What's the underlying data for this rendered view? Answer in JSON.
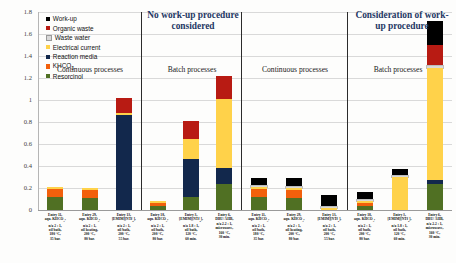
{
  "figure": {
    "panels": [
      {
        "title": "No work-up procedure considered"
      },
      {
        "title": "Consideration of work-up procedure"
      }
    ],
    "group_labels": [
      "Continuous processes",
      "Batch processes",
      "Continuous processes",
      "Batch processes"
    ]
  },
  "chart_data": {
    "type": "bar",
    "stacked": true,
    "title": "",
    "xlabel": "",
    "ylabel": "",
    "ylim": [
      0,
      1.8
    ],
    "yticks": [
      "0",
      "0.2",
      "0.4",
      "0.6",
      "0.8",
      "1",
      "1.2",
      "1.4",
      "1.6",
      "1.8"
    ],
    "grid": true,
    "legend_position": "top-left",
    "legend": [
      {
        "name": "Work-up",
        "color": "#000000"
      },
      {
        "name": "Organic waste",
        "color": "#B81B13"
      },
      {
        "name": "Waste water",
        "color": "#D9D9D9"
      },
      {
        "name": "Electrical current",
        "color": "#FFD24A"
      },
      {
        "name": "Reaction media",
        "color": "#12284C"
      },
      {
        "name": "KHCO3",
        "color": "#F2600C"
      },
      {
        "name": "Resorcinol",
        "color": "#507023"
      }
    ],
    "series": [
      {
        "name": "Resorcinol",
        "color": "#507023",
        "values": [
          0.115,
          0.112,
          0.0,
          0.04,
          0.115,
          0.235,
          0.115,
          0.112,
          0.0,
          0.04,
          0.0,
          0.235
        ]
      },
      {
        "name": "KHCO3",
        "color": "#F2600C",
        "values": [
          0.075,
          0.073,
          0.0,
          0.028,
          0.0,
          0.0,
          0.075,
          0.073,
          0.0,
          0.028,
          0.0,
          0.0
        ]
      },
      {
        "name": "Reaction media",
        "color": "#12284C",
        "values": [
          0.0,
          0.0,
          0.865,
          0.0,
          0.345,
          0.145,
          0.0,
          0.0,
          0.0,
          0.0,
          0.0,
          0.04
        ]
      },
      {
        "name": "Electrical current",
        "color": "#FFD24A",
        "values": [
          0.015,
          0.015,
          0.02,
          0.015,
          0.185,
          0.63,
          0.015,
          0.015,
          0.02,
          0.015,
          0.3,
          1.02
        ]
      },
      {
        "name": "Waste water",
        "color": "#D9D9D9",
        "values": [
          0.0,
          0.0,
          0.0,
          0.0,
          0.0,
          0.0,
          0.012,
          0.012,
          0.01,
          0.012,
          0.01,
          0.012
        ]
      },
      {
        "name": "Organic waste",
        "color": "#B81B13",
        "values": [
          0.0,
          0.0,
          0.13,
          0.0,
          0.16,
          0.21,
          0.0,
          0.0,
          0.0,
          0.0,
          0.0,
          0.19
        ]
      },
      {
        "name": "Work-up",
        "color": "#000000",
        "values": [
          0.0,
          0.0,
          0.0,
          0.0,
          0.0,
          0.0,
          0.075,
          0.075,
          0.105,
          0.065,
          0.065,
          0.225
        ]
      }
    ],
    "categories": [
      "Entry 11, aqu. KHCO3, n/a 2 : 1, oil bath, 180 °C, 35 bar.",
      "Entry 29, aqu. KHCO3, n/a 2 : 1, oil heating, 200 °C, 80 bar.",
      "Entry 13, [EMIM][NTf2], n/a 2 : 1, oil bath, 200 °C, 55 bar.",
      "Entry 18, aqu. KHCO3, n/a 2 : 1, oil bath, 200 °C, 80 bar.",
      "Entry 3, [EMIM][NTf2], n/a 1.8 : 1, oil bath, 120 °C, 60 min.",
      "Entry 6, DBU/ AHB, n/a 2.2 : 1, microwave, 160 °C, 30 min.",
      "Entry 11, aqu. KHCO3, n/a 2 : 1, oil bath, 180 °C, 35 bar.",
      "Entry 29, aqu. KHCO3, n/a 2 : 1, oil heating, 200 °C, 80 bar.",
      "Entry 13, [EMIM][NTf2], n/a 2 : 1, oil bath, 200 °C, 55 bar.",
      "Entry 18, aqu. KHCO3, n/a 2 : 1, oil bath, 200 °C, 80 bar.",
      "Entry 3, [EMIM][NTf2], n/a 1.8 : 1, oil bath, 120 °C, 60 min.",
      "Entry 6, DBU/ AHB, n/a 2.2 : 1, microwave, 160 °C, 30 min."
    ],
    "category_lines": [
      [
        "Entry 11,",
        "aqu. KHCO3,",
        "n/a 2 : 1,",
        "oil bath,",
        "180 °C,",
        "35 bar."
      ],
      [
        "Entry 29,",
        "aqu. KHCO3,",
        "n/a 2 : 1,",
        "oil heating,",
        "200 °C,",
        "80 bar."
      ],
      [
        "Entry 13,",
        "[EMIM][NTf2],",
        "n/a 2 : 1,",
        "oil bath,",
        "200 °C,",
        "55 bar."
      ],
      [
        "Entry 18,",
        "aqu. KHCO3,",
        "n/a 2 : 1,",
        "oil bath,",
        "200 °C,",
        "80 bar."
      ],
      [
        "Entry 3,",
        "[EMIM][NTf2],",
        "n/a 1.8 : 1,",
        "oil bath,",
        "120 °C,",
        "60 min."
      ],
      [
        "Entry 6,",
        "DBU/ AHB,",
        "n/a 2.2 : 1,",
        "microwave,",
        "160 °C,",
        "30 min."
      ],
      [
        "Entry 11,",
        "aqu. KHCO3,",
        "n/a 2 : 1,",
        "oil bath,",
        "180 °C,",
        "35 bar."
      ],
      [
        "Entry 29,",
        "aqu. KHCO3,",
        "n/a 2 : 1,",
        "oil heating,",
        "200 °C,",
        "80 bar."
      ],
      [
        "Entry 13,",
        "[EMIM][NTf2],",
        "n/a 2 : 1,",
        "oil bath,",
        "200 °C,",
        "55 bar."
      ],
      [
        "Entry 18,",
        "aqu. KHCO3,",
        "n/a 2 : 1,",
        "oil bath,",
        "200 °C,",
        "80 bar."
      ],
      [
        "Entry 3,",
        "[EMIM][NTf2],",
        "n/a 1.8 : 1,",
        "oil bath,",
        "120 °C,",
        "60 min."
      ],
      [
        "Entry 6,",
        "DBU/ AHB,",
        "n/a 2.2 : 1,",
        "microwave,",
        "160 °C,",
        "30 min."
      ]
    ],
    "group_of_bar": [
      0,
      0,
      0,
      1,
      1,
      1,
      2,
      2,
      2,
      3,
      3,
      3
    ]
  }
}
